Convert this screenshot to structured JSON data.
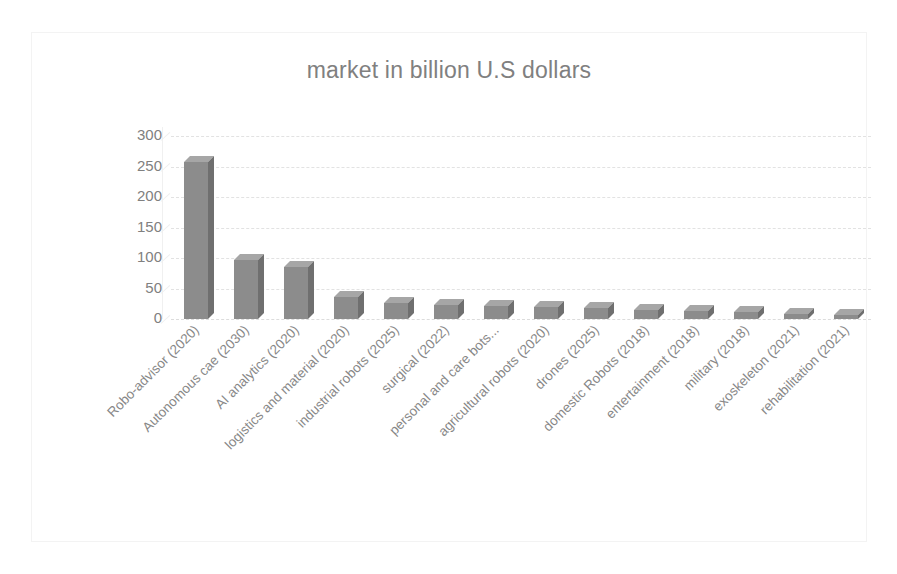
{
  "chart_data": {
    "type": "bar",
    "title": "market in billion U.S dollars",
    "xlabel": "",
    "ylabel": "",
    "ylim": [
      0,
      300
    ],
    "yticks": [
      300,
      250,
      200,
      150,
      100,
      50,
      0
    ],
    "grid": true,
    "legend": false,
    "style": "3d-column",
    "bar_color": "#8c8c8c",
    "bar_top_color": "#a6a6a6",
    "bar_side_color": "#6f6f6f",
    "gridline_color": "#e2e2e2",
    "text_color": "#808080",
    "frame_color": "#f3f3f3",
    "background": "#ffffff",
    "label_rotation": -45,
    "categories": [
      "Robo-advisor (2020)",
      "Autonomous cae (2030)",
      "AI analytics (2020)",
      "logistics and material (2020)",
      "industrial robots (2025)",
      "surgical (2022)",
      "personal and care bots...",
      "agricultural robots (2020)",
      "drones (2025)",
      "domestic Robots (2018)",
      "entertainment (2018)",
      "military (2018)",
      "exoskeleton (2021)",
      "rehabilitation (2021)"
    ],
    "values": [
      258,
      96,
      86,
      36,
      26,
      23,
      21,
      20,
      18,
      15,
      13,
      11,
      8,
      7
    ]
  }
}
